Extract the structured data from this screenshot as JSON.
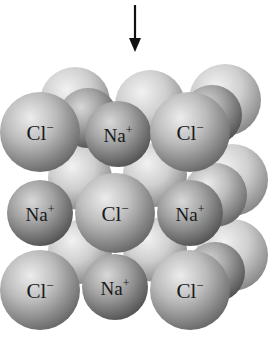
{
  "diagram": {
    "arrow": {
      "direction": "down",
      "x": 135,
      "y1": 5,
      "y2": 50
    },
    "colors": {
      "background": "#ffffff",
      "sphere_light": "#e6e6e6",
      "sphere_mid": "#b4b4b4",
      "sphere_dark": "#6e6e6e",
      "label": "#1a1a1a",
      "arrow": "#111111"
    },
    "ions": {
      "chloride": {
        "symbol": "Cl",
        "charge": "−",
        "radius": 40
      },
      "sodium": {
        "symbol": "Na",
        "charge": "+",
        "radius": 33
      }
    },
    "front_face": [
      {
        "id": "r1c1",
        "type": "chloride",
        "cx": 40,
        "cy": 132,
        "label": "Cl",
        "charge": "−"
      },
      {
        "id": "r1c2",
        "type": "sodium",
        "cx": 118,
        "cy": 132,
        "label": "Na",
        "charge": "+"
      },
      {
        "id": "r1c3",
        "type": "chloride",
        "cx": 190,
        "cy": 132,
        "label": "Cl",
        "charge": "−"
      },
      {
        "id": "r2c1",
        "type": "sodium",
        "cx": 40,
        "cy": 213,
        "label": "Na",
        "charge": "+"
      },
      {
        "id": "r2c2",
        "type": "chloride",
        "cx": 115,
        "cy": 213,
        "label": "Cl",
        "charge": "−"
      },
      {
        "id": "r2c3",
        "type": "sodium",
        "cx": 190,
        "cy": 213,
        "label": "Na",
        "charge": "+"
      },
      {
        "id": "r3c1",
        "type": "chloride",
        "cx": 40,
        "cy": 290,
        "label": "Cl",
        "charge": "−"
      },
      {
        "id": "r3c2",
        "type": "sodium",
        "cx": 115,
        "cy": 287,
        "label": "Na",
        "charge": "+"
      },
      {
        "id": "r3c3",
        "type": "chloride",
        "cx": 190,
        "cy": 290,
        "label": "Cl",
        "charge": "−"
      }
    ]
  }
}
